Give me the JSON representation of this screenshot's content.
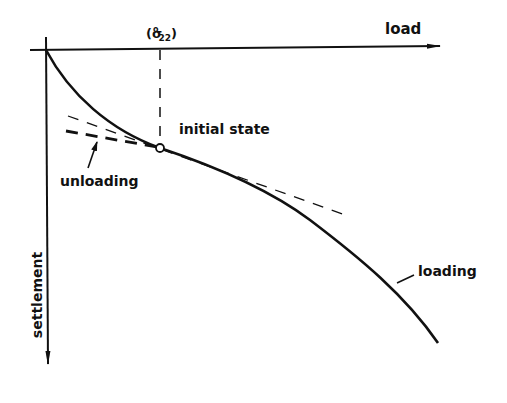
{
  "diagram": {
    "type": "load-settlement curve",
    "axes": {
      "horizontal_label": "load",
      "vertical_label": "settlement",
      "stress_marker": {
        "symbol": "σ",
        "subscript": "22",
        "superscript": "o",
        "text": "(σ°22)"
      }
    },
    "labels": {
      "initial_state": "initial state",
      "unloading": "unloading",
      "loading": "loading"
    },
    "colors": {
      "ink": "#111111",
      "background": "#ffffff"
    }
  }
}
